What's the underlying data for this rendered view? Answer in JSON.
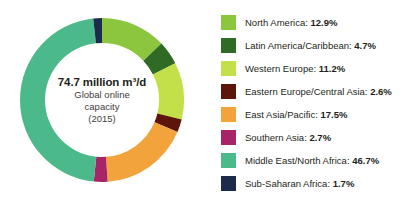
{
  "center": {
    "value": "74.7 million m³/d",
    "line2": "Global online",
    "line3": "capacity",
    "line4": "(2015)"
  },
  "chart_data": {
    "type": "pie",
    "title": "",
    "subtitle": "",
    "variant": "donut",
    "start_angle_deg": 0,
    "direction": "clockwise",
    "units": "percent of global online capacity",
    "center_label": "74.7 million m³/d Global online capacity (2015)",
    "total_value": "74.7 million m³/d",
    "year": "2015",
    "legend_position": "right",
    "categories": [
      "North America",
      "Latin America/Caribbean",
      "Western Europe",
      "Eastern Europe/Central Asia",
      "East Asia/Pacific",
      "Southern Asia",
      "Middle East/North Africa",
      "Sub-Saharan Africa"
    ],
    "values": [
      12.9,
      4.7,
      11.2,
      2.6,
      17.5,
      2.7,
      46.7,
      1.7
    ],
    "value_labels": [
      "12.9%",
      "4.7%",
      "11.2%",
      "2.6%",
      "17.5%",
      "2.7%",
      "46.7%",
      "1.7%"
    ],
    "colors": [
      "#8CC63F",
      "#2F6B24",
      "#C3E04B",
      "#5C1509",
      "#F2A33C",
      "#A82468",
      "#4BB98A",
      "#1C2B4B"
    ]
  },
  "legend": {
    "items": [
      {
        "label": "North America:",
        "value": "12.9%",
        "color": "#8CC63F",
        "icon": "color-swatch"
      },
      {
        "label": "Latin America/Caribbean:",
        "value": "4.7%",
        "color": "#2F6B24",
        "icon": "color-swatch"
      },
      {
        "label": "Western Europe:",
        "value": "11.2%",
        "color": "#C3E04B",
        "icon": "color-swatch"
      },
      {
        "label": "Eastern Europe/Central Asia:",
        "value": "2.6%",
        "color": "#5C1509",
        "icon": "color-swatch"
      },
      {
        "label": "East Asia/Pacific:",
        "value": "17.5%",
        "color": "#F2A33C",
        "icon": "color-swatch"
      },
      {
        "label": "Southern Asia:",
        "value": "2.7%",
        "color": "#A82468",
        "icon": "color-swatch"
      },
      {
        "label": "Middle East/North Africa:",
        "value": "46.7%",
        "color": "#4BB98A",
        "icon": "color-swatch"
      },
      {
        "label": "Sub-Saharan Africa:",
        "value": "1.7%",
        "color": "#1C2B4B",
        "icon": "color-swatch"
      }
    ]
  }
}
